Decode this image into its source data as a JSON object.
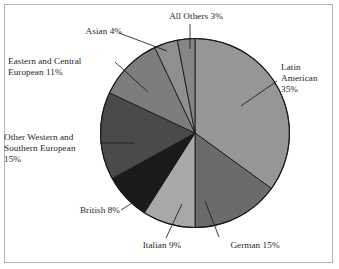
{
  "figure": {
    "background_color": "#ffffff",
    "frame_color": "#b2b2b2",
    "outline_color": "#1a1a1a",
    "leader_color": "#1a1a1a"
  },
  "chart_data": {
    "type": "pie",
    "title": "",
    "subtitle": "",
    "xlabel": "",
    "ylabel": "",
    "legend_position": "none",
    "grid": false,
    "start_angle_deg": 0,
    "direction": "clockwise",
    "labels_show_percent": true,
    "categories": [
      "Latin American",
      "German",
      "Italian",
      "British",
      "Other Western and Southern European",
      "Eastern and Central European",
      "Asian",
      "All Others"
    ],
    "values": [
      35,
      15,
      9,
      8,
      15,
      11,
      4,
      3
    ],
    "colors": [
      "#969696",
      "#6b6b6b",
      "#a8a8a8",
      "#1a1a1a",
      "#4a4a4a",
      "#7d7d7d",
      "#8f8f8f",
      "#858585"
    ],
    "slices": [
      {
        "name": "latin-american",
        "label_line1": "Latin",
        "label_line2": "American",
        "label_line3": "35%",
        "label_full": "Latin American 35%",
        "value": 35,
        "percent": "35%",
        "color": "#969696"
      },
      {
        "name": "german",
        "label_full": "German 15%",
        "value": 15,
        "percent": "15%",
        "color": "#6b6b6b"
      },
      {
        "name": "italian",
        "label_full": "Italian 9%",
        "value": 9,
        "percent": "9%",
        "color": "#a8a8a8"
      },
      {
        "name": "british",
        "label_full": "British 8%",
        "value": 8,
        "percent": "8%",
        "color": "#1a1a1a"
      },
      {
        "name": "other-western-and-southern-european",
        "label_line1": "Other Western and",
        "label_line2": "Southern European",
        "label_line3": "15%",
        "label_full": "Other Western and Southern European 15%",
        "value": 15,
        "percent": "15%",
        "color": "#4a4a4a"
      },
      {
        "name": "eastern-and-central-european",
        "label_line1": "Eastern and Central",
        "label_line2": "European 11%",
        "label_full": "Eastern and Central European 11%",
        "value": 11,
        "percent": "11%",
        "color": "#7d7d7d"
      },
      {
        "name": "asian",
        "label_full": "Asian 4%",
        "value": 4,
        "percent": "4%",
        "color": "#8f8f8f"
      },
      {
        "name": "all-others",
        "label_full": "All Others 3%",
        "value": 3,
        "percent": "3%",
        "color": "#858585"
      }
    ]
  },
  "labels": {
    "latin_american_l1": "Latin",
    "latin_american_l2": "American",
    "latin_american_l3": "35%",
    "german": "German 15%",
    "italian": "Italian 9%",
    "british": "British 8%",
    "other_western_l1": "Other Western and",
    "other_western_l2": "Southern European",
    "other_western_l3": "15%",
    "eastern_central_l1": "Eastern and Central",
    "eastern_central_l2": "European 11%",
    "asian": "Asian 4%",
    "all_others": "All Others 3%"
  }
}
